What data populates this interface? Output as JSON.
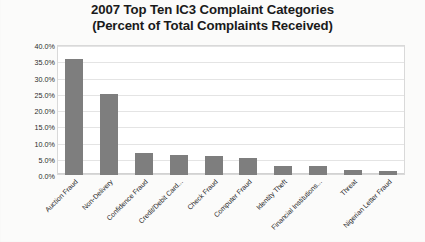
{
  "chart_data": {
    "type": "bar",
    "title": "2007 Top Ten IC3 Complaint Categories (Percent of Total Complaints Received)",
    "title_lines": [
      "2007 Top Ten IC3 Complaint Categories",
      "(Percent of Total Complaints Received)"
    ],
    "xlabel": "",
    "ylabel": "",
    "ylim": [
      0,
      40
    ],
    "grid": true,
    "legend": "none",
    "y_ticks": [
      "0.0%",
      "5.0%",
      "10.0%",
      "15.0%",
      "20.0%",
      "25.0%",
      "30.0%",
      "35.0%",
      "40.0%"
    ],
    "y_tick_values": [
      0,
      5,
      10,
      15,
      20,
      25,
      30,
      35,
      40
    ],
    "categories": [
      "Auction Fraud",
      "Non-Delivery",
      "Confidence Fraud",
      "Credit/Debit Card...",
      "Check Fraud",
      "Computer Fraud",
      "Identity Theft",
      "Financial Institutions...",
      "Threat",
      "Nigerian Letter Fraud"
    ],
    "values": [
      35.7,
      24.9,
      6.7,
      6.3,
      6.0,
      5.3,
      2.9,
      2.7,
      1.6,
      1.1
    ],
    "bar_color": "#7e7e7e",
    "grid_color": "#e4e4e4",
    "background_color": "#ffffff"
  }
}
